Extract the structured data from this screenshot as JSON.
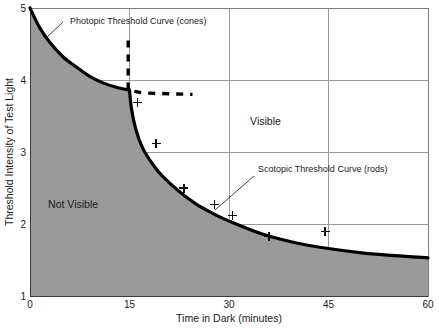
{
  "chart_data": {
    "type": "line",
    "title": "",
    "xlabel": "Time in Dark (minutes)",
    "ylabel": "Threshold Intensity of Test Light",
    "xlim": [
      0,
      60
    ],
    "ylim": [
      1,
      5
    ],
    "xticks": [
      0,
      15,
      30,
      45,
      60
    ],
    "yticks": [
      1,
      2,
      3,
      4,
      5
    ],
    "xtick_labels": [
      "0",
      "15",
      "30",
      "45",
      "60"
    ],
    "ytick_labels": [
      "1",
      "2",
      "3",
      "4",
      "5"
    ],
    "grid": true,
    "legend": "none",
    "series": [
      {
        "name": "Photopic Threshold Curve (cones)",
        "style": "solid-thick",
        "points": [
          {
            "x": 0.0,
            "y": 5.0
          },
          {
            "x": 1.5,
            "y": 4.72
          },
          {
            "x": 3.0,
            "y": 4.52
          },
          {
            "x": 5.0,
            "y": 4.32
          },
          {
            "x": 7.0,
            "y": 4.18
          },
          {
            "x": 9.0,
            "y": 4.05
          },
          {
            "x": 11.0,
            "y": 3.96
          },
          {
            "x": 13.0,
            "y": 3.9
          },
          {
            "x": 15.0,
            "y": 3.86
          }
        ]
      },
      {
        "name": "Scotopic Threshold Curve (rods)",
        "style": "solid-thick",
        "points": [
          {
            "x": 15.0,
            "y": 3.86
          },
          {
            "x": 15.3,
            "y": 3.6
          },
          {
            "x": 16.0,
            "y": 3.3
          },
          {
            "x": 17.0,
            "y": 3.05
          },
          {
            "x": 18.5,
            "y": 2.83
          },
          {
            "x": 20.0,
            "y": 2.66
          },
          {
            "x": 22.5,
            "y": 2.45
          },
          {
            "x": 25.0,
            "y": 2.28
          },
          {
            "x": 27.5,
            "y": 2.15
          },
          {
            "x": 30.0,
            "y": 2.04
          },
          {
            "x": 35.0,
            "y": 1.86
          },
          {
            "x": 40.0,
            "y": 1.74
          },
          {
            "x": 45.0,
            "y": 1.66
          },
          {
            "x": 50.0,
            "y": 1.6
          },
          {
            "x": 55.0,
            "y": 1.56
          },
          {
            "x": 60.0,
            "y": 1.53
          }
        ]
      },
      {
        "name": "photopic extension (dashed)",
        "style": "dashed",
        "points": [
          {
            "x": 14.8,
            "y": 4.55
          },
          {
            "x": 14.8,
            "y": 3.86
          },
          {
            "x": 17.0,
            "y": 3.82
          },
          {
            "x": 24.5,
            "y": 3.8
          }
        ]
      }
    ],
    "data_markers": {
      "name": "measured threshold data points",
      "symbol": "plus",
      "points": [
        {
          "x": 16.2,
          "y": 3.69
        },
        {
          "x": 19.0,
          "y": 3.12
        },
        {
          "x": 23.2,
          "y": 2.5
        },
        {
          "x": 27.8,
          "y": 2.27
        },
        {
          "x": 30.5,
          "y": 2.12
        },
        {
          "x": 36.0,
          "y": 1.83
        },
        {
          "x": 44.5,
          "y": 1.9
        }
      ]
    },
    "regions": [
      {
        "label": "Not Visible",
        "x": 6.5,
        "y": 2.22,
        "fill": "#9a9a9a"
      },
      {
        "label": "Visible",
        "x": 35.5,
        "y": 3.38,
        "fill": "#ffffff"
      }
    ],
    "annotations": [
      {
        "text": "Photopic Threshold Curve (cones)",
        "text_x": 70,
        "text_y": 24,
        "leader_from_x": 63,
        "leader_from_y": 22,
        "leader_to_x": 46,
        "leader_to_y": 38
      },
      {
        "text": "Scotopic Threshold Curve (rods)",
        "text_x": 258,
        "text_y": 172,
        "leader_from_x": 254,
        "leader_from_y": 176,
        "leader_to_x": 215,
        "leader_to_y": 210
      }
    ],
    "colors": {
      "shaded_region": "#9a9a9a",
      "curve": "#000000",
      "gridline": "#9a9a9a",
      "frame": "#7d7d7d",
      "background": "#ffffff",
      "text": "#1a1a1a"
    }
  }
}
